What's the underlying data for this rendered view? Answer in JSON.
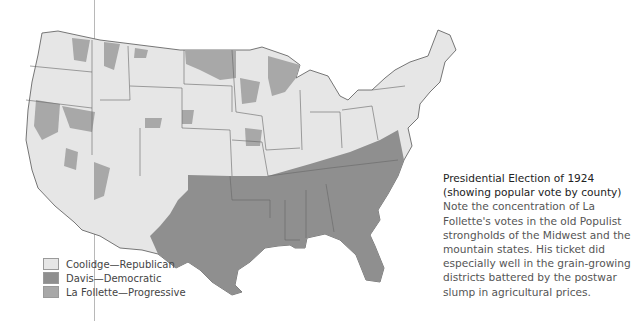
{
  "map": {
    "title": "Presidential Election of 1924",
    "subtitle": "(showing popular vote by county)",
    "description": "Note the concentration of La Follette's votes in the old Populist strongholds of the Midwest and the mountain states. His ticket did especially well in the grain-growing districts battered by the postwar slump in agricultural prices.",
    "colors": {
      "coolidge": "#e6e6e6",
      "davis": "#8f8f8f",
      "la_follette": "#a8a8a8",
      "border": "#555555"
    }
  },
  "legend": {
    "items": [
      {
        "label": "Coolidge—Republican",
        "color": "#e6e6e6"
      },
      {
        "label": "Davis—Democratic",
        "color": "#8f8f8f"
      },
      {
        "label": "La Follette—Progressive",
        "color": "#a8a8a8"
      }
    ]
  }
}
